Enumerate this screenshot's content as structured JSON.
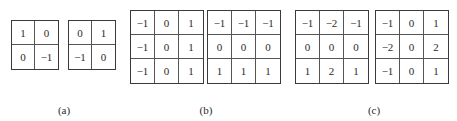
{
  "groups": [
    {
      "caption": "(a)",
      "kernels": [
        {
          "name": "roberts-kernel-1",
          "values": [
            "1",
            "0",
            "0",
            "−1"
          ]
        },
        {
          "name": "roberts-kernel-2",
          "values": [
            "0",
            "1",
            "−1",
            "0"
          ]
        }
      ]
    },
    {
      "caption": "(b)",
      "kernels": [
        {
          "name": "prewitt-kernel-x",
          "values": [
            "−1",
            "0",
            "1",
            "−1",
            "0",
            "1",
            "−1",
            "0",
            "1"
          ]
        },
        {
          "name": "prewitt-kernel-y",
          "values": [
            "−1",
            "−1",
            "−1",
            "0",
            "0",
            "0",
            "1",
            "1",
            "1"
          ]
        }
      ]
    },
    {
      "caption": "(c)",
      "kernels": [
        {
          "name": "sobel-kernel-y",
          "values": [
            "−1",
            "−2",
            "−1",
            "0",
            "0",
            "0",
            "1",
            "2",
            "1"
          ]
        },
        {
          "name": "sobel-kernel-x",
          "values": [
            "−1",
            "0",
            "1",
            "−2",
            "0",
            "2",
            "−1",
            "0",
            "1"
          ]
        }
      ]
    }
  ]
}
